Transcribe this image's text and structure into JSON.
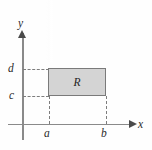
{
  "figure": {
    "axes": {
      "x_label": "x",
      "y_label": "y"
    },
    "ticks": {
      "x": [
        "a",
        "b"
      ],
      "y": [
        "c",
        "d"
      ]
    },
    "region": {
      "label": "R"
    },
    "colors": {
      "region_fill": "#d4d4d4",
      "region_border": "#7a7a7a",
      "axis": "#8a8a8a",
      "dash": "#7d7d7d",
      "text": "#2b2b2b",
      "background": "#fefefe"
    }
  }
}
